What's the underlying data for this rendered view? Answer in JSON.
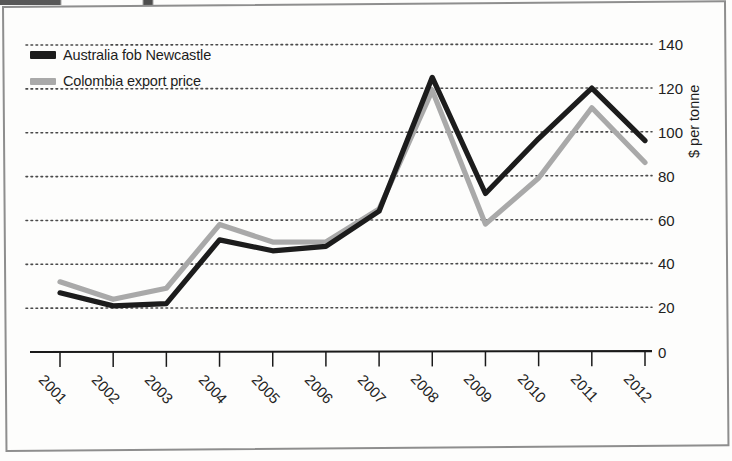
{
  "figure": {
    "ylabel": "$ per tonne",
    "axis_line_color": "#1a1a1a",
    "grid_color": "#4a4a4a",
    "frame_color": "#8e8e8e"
  },
  "legend": [
    {
      "label": "Australia fob Newcastle",
      "color": "#1c1c1c",
      "swatch": "legend-swatch-black"
    },
    {
      "label": "Colombia export price",
      "color": "#a9a9a9",
      "swatch": "legend-swatch-grey"
    }
  ],
  "yticks": [
    "0",
    "20",
    "40",
    "60",
    "80",
    "100",
    "120",
    "140"
  ],
  "chart_data": {
    "type": "line",
    "title": "",
    "xlabel": "",
    "ylabel": "$ per tonne",
    "ylim": [
      0,
      140
    ],
    "ytick_step": 20,
    "grid": true,
    "legend_position": "top-left",
    "categories": [
      "2001",
      "2002",
      "2003",
      "2004",
      "2005",
      "2006",
      "2007",
      "2008",
      "2009",
      "2010",
      "2011",
      "2012"
    ],
    "series": [
      {
        "name": "Australia fob Newcastle",
        "color": "#1c1c1c",
        "values": [
          27,
          21,
          22,
          51,
          46,
          48,
          64,
          125,
          72,
          97,
          120,
          96
        ]
      },
      {
        "name": "Colombia export price",
        "color": "#a9a9a9",
        "values": [
          32,
          24,
          29,
          58,
          50,
          50,
          65,
          119,
          58,
          79,
          111,
          86
        ]
      }
    ]
  }
}
